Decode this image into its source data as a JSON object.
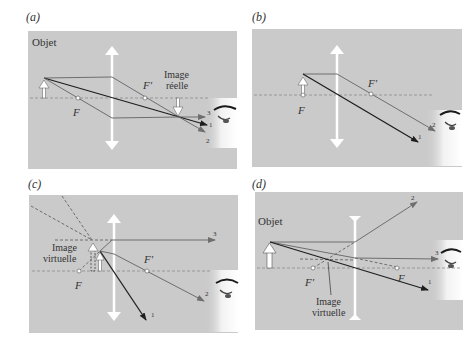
{
  "colors": {
    "panel_bg": "#cacaca",
    "axis": "#8a8a8a",
    "ray_dark": "#1e1e1e",
    "ray_gray": "#6e6e6e",
    "lens": "#ffffff",
    "text": "#333333"
  },
  "panels": [
    {
      "id": "a",
      "label": "(a)",
      "texts": {
        "object": "Objet",
        "focal_F": "F",
        "focal_Fprime": "F′",
        "image_line1": "Image",
        "image_line2": "réelle",
        "ray1": "1",
        "ray2": "2",
        "ray3": "3"
      }
    },
    {
      "id": "b",
      "label": "(b)",
      "texts": {
        "focal_F": "F",
        "focal_Fprime": "F′",
        "ray1": "1",
        "ray2": "2"
      }
    },
    {
      "id": "c",
      "label": "(c)",
      "texts": {
        "focal_F": "F",
        "focal_Fprime": "F′",
        "image_line1": "Image",
        "image_line2": "virtuelle",
        "ray1": "1",
        "ray2": "2",
        "ray3": "3"
      }
    },
    {
      "id": "d",
      "label": "(d)",
      "texts": {
        "object": "Objet",
        "focal_F": "F",
        "focal_Fprime": "F′",
        "image_line1": "Image",
        "image_line2": "virtuelle",
        "ray1": "1",
        "ray2": "2",
        "ray3": "3"
      }
    }
  ]
}
